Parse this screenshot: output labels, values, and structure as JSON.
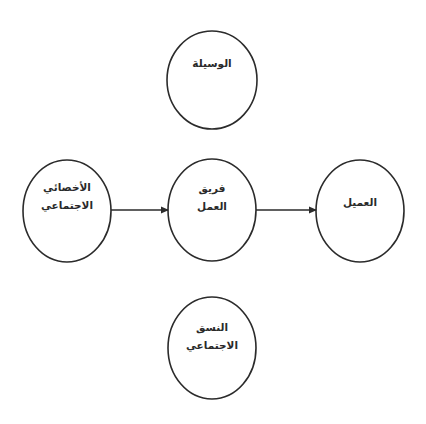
{
  "diagram": {
    "type": "flow",
    "stroke_color": "#2b2b2b",
    "background": "#ffffff",
    "nodes": [
      {
        "id": "means",
        "lines": [
          "الوسيلة"
        ],
        "cx": 212,
        "cy": 80,
        "rx": 45,
        "ry": 49
      },
      {
        "id": "social-worker",
        "lines": [
          "الأخصائي",
          "الاجتماعي"
        ],
        "cx": 67,
        "cy": 211,
        "rx": 44,
        "ry": 51
      },
      {
        "id": "team",
        "lines": [
          "فريق",
          "العمل"
        ],
        "cx": 212,
        "cy": 210,
        "rx": 44,
        "ry": 51
      },
      {
        "id": "client",
        "lines": [
          "العميل"
        ],
        "cx": 360,
        "cy": 211,
        "rx": 44,
        "ry": 51
      },
      {
        "id": "social-system",
        "lines": [
          "النسق",
          "الاجتماعي"
        ],
        "cx": 212,
        "cy": 348,
        "rx": 44,
        "ry": 51
      }
    ],
    "edges": [
      {
        "from": "social-worker",
        "to": "team",
        "x1": 111,
        "x2": 168,
        "y": 210
      },
      {
        "from": "team",
        "to": "client",
        "x1": 256,
        "x2": 316,
        "y": 210
      }
    ]
  }
}
